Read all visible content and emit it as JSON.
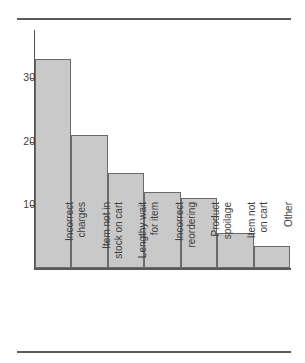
{
  "figure": {
    "rules": {
      "top": true,
      "bottom": true
    }
  },
  "chart_data": {
    "type": "bar",
    "title": "",
    "subtitle": "",
    "xlabel": "",
    "ylabel": "",
    "categories": [
      "Incorrect charges",
      "Item not in stock on cart",
      "Lengthy wait for item",
      "Incorrect reordering",
      "Product spoilage",
      "Item not on cart",
      "Other"
    ],
    "category_lines": [
      [
        "Incorrect",
        "charges"
      ],
      [
        "Item not in",
        "stock on cart"
      ],
      [
        "Lengthy wait",
        "for item"
      ],
      [
        "Incorrect",
        "reordering"
      ],
      [
        "Product",
        "spoilage"
      ],
      [
        "Item not",
        "on cart"
      ],
      [
        "Other",
        ""
      ]
    ],
    "values": [
      33,
      21,
      15,
      12,
      11,
      5.5,
      3.5
    ],
    "ylim": [
      0,
      35
    ],
    "yticks": [
      10,
      20,
      30
    ],
    "ytick_labels": [
      "10",
      "20",
      "30"
    ],
    "grid": false,
    "legend": null,
    "bar_fill": "#c9c9c9",
    "bar_edge": "#6a6a6a",
    "axis_color": "#555555",
    "text_color": "#3d3d3d"
  }
}
